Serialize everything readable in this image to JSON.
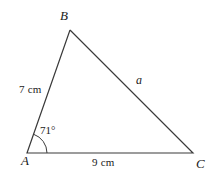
{
  "figure": {
    "type": "geometry-diagram",
    "shape": "triangle",
    "background_color": "#ffffff",
    "stroke_color": "#3a3a3a",
    "text_color": "#1a1a1a",
    "vertices": [
      {
        "name": "B",
        "label": "B",
        "x": 70,
        "y": 30
      },
      {
        "name": "A",
        "label": "A",
        "x": 27,
        "y": 153
      },
      {
        "name": "C",
        "label": "C",
        "x": 193,
        "y": 153
      }
    ],
    "sides": [
      {
        "name": "side-AB",
        "label": "7 cm",
        "from": "A",
        "to": "B",
        "value": 7,
        "unit": "cm"
      },
      {
        "name": "side-AC",
        "label": "9 cm",
        "from": "A",
        "to": "C",
        "value": 9,
        "unit": "cm"
      },
      {
        "name": "side-BC",
        "label": "a",
        "from": "B",
        "to": "C",
        "value": null,
        "unit": ""
      }
    ],
    "angles": [
      {
        "name": "angle-A",
        "at": "A",
        "label": "71°",
        "value": 71,
        "unit": "degrees",
        "arc_radius": 20
      }
    ],
    "polyline_points": "70,30 27,153 193,153 70,30"
  }
}
